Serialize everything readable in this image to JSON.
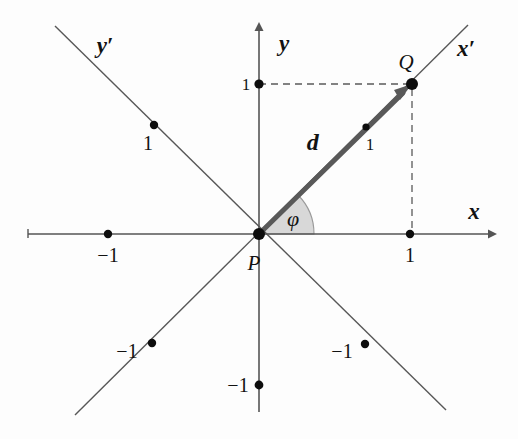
{
  "figure": {
    "kind": "coordinate-diagram",
    "background_color": "#fdfdfd",
    "line_color": "#4a4a4a",
    "axis_color": "#555555",
    "vector_color": "#595959",
    "sector_fill": "#d8d8d8",
    "sector_stroke": "#8a8a8a",
    "dash_color": "#5a5a5a",
    "point_color": "#0d0d0d"
  },
  "axes": {
    "x": {
      "label": "x",
      "arrow": true
    },
    "y": {
      "label": "y",
      "arrow": true
    },
    "x_prime": {
      "label": "x′",
      "arrow": false
    },
    "y_prime": {
      "label": "y′",
      "arrow": false
    }
  },
  "points": {
    "origin": {
      "label": "P",
      "x": 259,
      "y": 234
    },
    "q": {
      "label": "Q",
      "x": 412,
      "y": 84
    }
  },
  "vector": {
    "label": "d⃗",
    "from": "P",
    "to": "Q"
  },
  "angle": {
    "label": "φ",
    "from_axis": "x",
    "to": "d",
    "degrees": 44.5
  },
  "ticks": {
    "x_pos": {
      "label": "1",
      "x": 410,
      "y": 234
    },
    "x_neg": {
      "label": "−1",
      "x": 108,
      "y": 234
    },
    "y_pos": {
      "label": "1",
      "x": 259,
      "y": 84
    },
    "y_neg": {
      "label": "−1",
      "x": 259,
      "y": 385
    },
    "xprime_pos": {
      "label": "1",
      "x": 366,
      "y": 127
    },
    "xprime_neg": {
      "label": "−1",
      "x": 152,
      "y": 343
    },
    "yprime_pos": {
      "label": "1",
      "x": 154,
      "y": 125
    },
    "yprime_neg": {
      "label": "−1",
      "x": 365,
      "y": 344
    }
  },
  "guides": {
    "horizontal_dashed": {
      "from_x": 259,
      "to_x": 412,
      "y": 84
    },
    "vertical_dashed": {
      "x": 412,
      "from_y": 84,
      "to_y": 234
    }
  }
}
